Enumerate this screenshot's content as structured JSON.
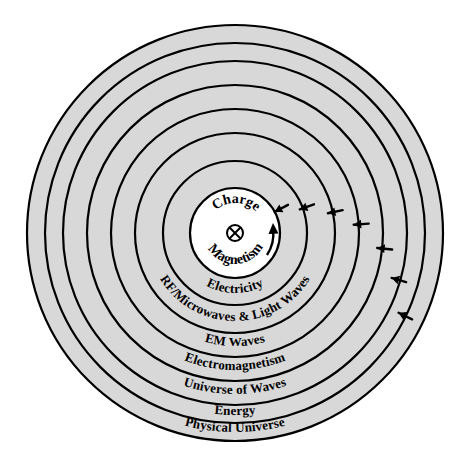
{
  "diagram": {
    "type": "concentric-rings",
    "center": {
      "cx": 235,
      "cy": 233
    },
    "colors": {
      "ring_fill": "#d8d8d8",
      "core_fill": "#ffffff",
      "stroke": "#000000",
      "background": "#ffffff",
      "text": "#000000"
    },
    "core": {
      "top_label": "Charge",
      "bottom_label": "Magnetism",
      "symbol": "circled-cross",
      "symbol_name": "charge-symbol",
      "has_curved_arrow": true,
      "radius": 45
    },
    "rings": [
      {
        "index": 0,
        "label": "Electricity",
        "outer_radius": 72,
        "label_radius": 60,
        "font_size": 13
      },
      {
        "index": 1,
        "label": "RF/Microwaves & Light Waves",
        "outer_radius": 100,
        "label_radius": 88,
        "font_size": 13
      },
      {
        "index": 2,
        "label": "EM Waves",
        "outer_radius": 124,
        "label_radius": 113,
        "font_size": 13
      },
      {
        "index": 3,
        "label": "Electromagnetism",
        "outer_radius": 148,
        "label_radius": 137,
        "font_size": 13
      },
      {
        "index": 4,
        "label": "Universe of Waves",
        "outer_radius": 172,
        "label_radius": 161,
        "font_size": 13
      },
      {
        "index": 5,
        "label": "Energy",
        "outer_radius": 190,
        "label_radius": 182,
        "font_size": 13
      },
      {
        "index": 6,
        "label": "Physical Universe",
        "outer_radius": 208,
        "label_radius": 199,
        "font_size": 13
      }
    ],
    "arrows": {
      "name": "inward-arrow",
      "count": 7,
      "direction": "inward",
      "radii": [
        60,
        84,
        110,
        134,
        158,
        178,
        197
      ],
      "angles_deg": [
        -28,
        -20,
        -12,
        -4,
        6,
        16,
        26
      ]
    }
  }
}
